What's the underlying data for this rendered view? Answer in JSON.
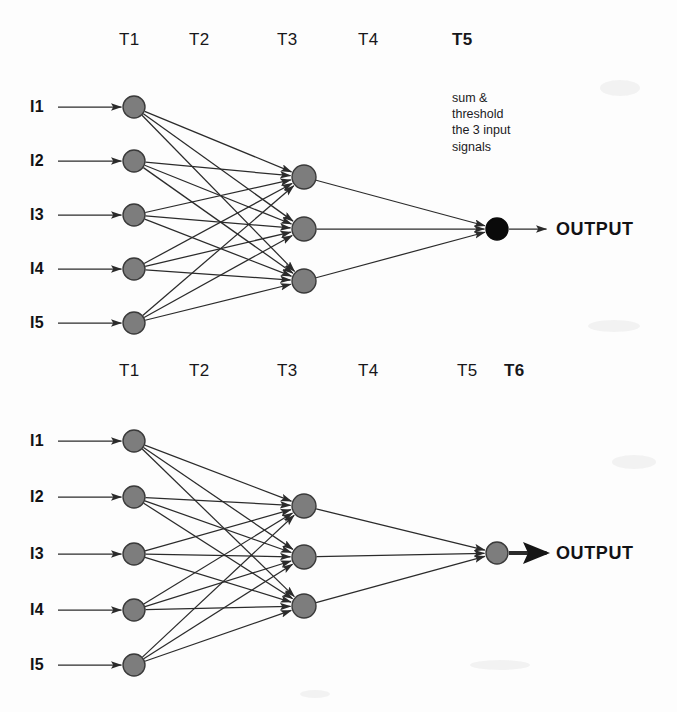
{
  "figure": {
    "background_color": "#fdfdfd",
    "node_fill": "#7d7d7d",
    "node_stroke": "#3a3a3a",
    "node_fill_active": "#0a0a0a",
    "edge_color": "#2b2b2b"
  },
  "diagrams": [
    {
      "id": "top-network",
      "name": "top-network",
      "time_labels": [
        {
          "text": "T1",
          "bold": false,
          "x": 119,
          "y": 30
        },
        {
          "text": "T2",
          "bold": false,
          "x": 189,
          "y": 30
        },
        {
          "text": "T3",
          "bold": false,
          "x": 277,
          "y": 30
        },
        {
          "text": "T4",
          "bold": false,
          "x": 358,
          "y": 30
        },
        {
          "text": "T5",
          "bold": true,
          "x": 452,
          "y": 30
        }
      ],
      "input_labels": [
        {
          "text": "I1",
          "x": 30,
          "y": 107
        },
        {
          "text": "I2",
          "x": 30,
          "y": 161
        },
        {
          "text": "I3",
          "x": 30,
          "y": 215
        },
        {
          "text": "I4",
          "x": 30,
          "y": 269
        },
        {
          "text": "I5",
          "x": 30,
          "y": 323
        }
      ],
      "input_nodes": [
        {
          "cx": 134,
          "cy": 107,
          "r": 11,
          "state": "gray"
        },
        {
          "cx": 134,
          "cy": 161,
          "r": 11,
          "state": "gray"
        },
        {
          "cx": 134,
          "cy": 215,
          "r": 11,
          "state": "gray"
        },
        {
          "cx": 134,
          "cy": 269,
          "r": 11,
          "state": "gray"
        },
        {
          "cx": 134,
          "cy": 323,
          "r": 11,
          "state": "gray"
        }
      ],
      "hidden_nodes": [
        {
          "cx": 304,
          "cy": 177,
          "r": 12,
          "state": "gray"
        },
        {
          "cx": 304,
          "cy": 229,
          "r": 12,
          "state": "gray"
        },
        {
          "cx": 304,
          "cy": 281,
          "r": 12,
          "state": "gray"
        }
      ],
      "output_node": {
        "cx": 497,
        "cy": 229,
        "r": 11,
        "state": "black"
      },
      "output_label": {
        "text": "OUTPUT",
        "x": 556,
        "y": 229
      },
      "output_arrow_bold": false,
      "annotation": {
        "lines": [
          "sum &",
          "threshold",
          "the 3 input",
          "signals"
        ],
        "x": 452,
        "y": 90
      }
    },
    {
      "id": "bottom-network",
      "name": "bottom-network",
      "time_labels": [
        {
          "text": "T1",
          "bold": false,
          "x": 119,
          "y": 361
        },
        {
          "text": "T2",
          "bold": false,
          "x": 189,
          "y": 361
        },
        {
          "text": "T3",
          "bold": false,
          "x": 277,
          "y": 361
        },
        {
          "text": "T4",
          "bold": false,
          "x": 358,
          "y": 361
        },
        {
          "text": "T5",
          "bold": false,
          "x": 457,
          "y": 361
        },
        {
          "text": "T6",
          "bold": true,
          "x": 504,
          "y": 361
        }
      ],
      "input_labels": [
        {
          "text": "I1",
          "x": 30,
          "y": 441
        },
        {
          "text": "I2",
          "x": 30,
          "y": 497
        },
        {
          "text": "I3",
          "x": 30,
          "y": 554
        },
        {
          "text": "I4",
          "x": 30,
          "y": 610
        },
        {
          "text": "I5",
          "x": 30,
          "y": 665
        }
      ],
      "input_nodes": [
        {
          "cx": 134,
          "cy": 441,
          "r": 11,
          "state": "gray"
        },
        {
          "cx": 134,
          "cy": 497,
          "r": 11,
          "state": "gray"
        },
        {
          "cx": 134,
          "cy": 554,
          "r": 11,
          "state": "gray"
        },
        {
          "cx": 134,
          "cy": 610,
          "r": 11,
          "state": "gray"
        },
        {
          "cx": 134,
          "cy": 665,
          "r": 11,
          "state": "gray"
        }
      ],
      "hidden_nodes": [
        {
          "cx": 304,
          "cy": 506,
          "r": 12,
          "state": "gray"
        },
        {
          "cx": 304,
          "cy": 557,
          "r": 12,
          "state": "gray"
        },
        {
          "cx": 304,
          "cy": 606,
          "r": 12,
          "state": "gray"
        }
      ],
      "output_node": {
        "cx": 497,
        "cy": 553,
        "r": 11,
        "state": "gray"
      },
      "output_label": {
        "text": "OUTPUT",
        "x": 556,
        "y": 553
      },
      "output_arrow_bold": true,
      "annotation": null
    }
  ],
  "connectivity": {
    "input_to_hidden": "fully-connected 5x3",
    "hidden_to_output": "fully-connected 3x1",
    "input_feed_arrow_start_x": 58
  }
}
